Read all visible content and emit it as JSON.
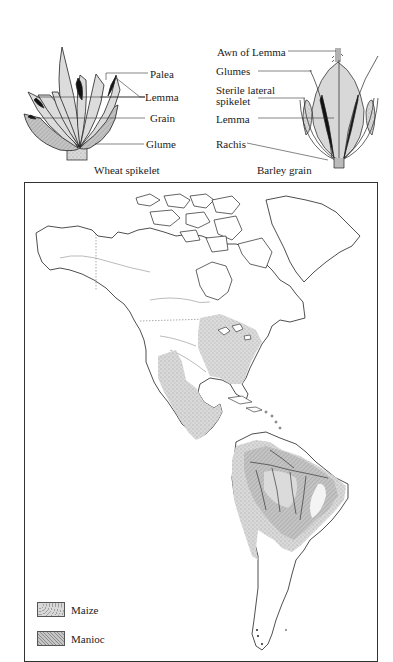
{
  "figures": {
    "wheat": {
      "caption": "Wheat spikelet",
      "labels": [
        "Palea",
        "Lemma",
        "Grain",
        "Glume"
      ]
    },
    "barley": {
      "caption": "Barley grain",
      "labels": [
        "Awn of Lemma",
        "Glumes",
        "Sterile lateral",
        "spikelet",
        "Lemma",
        "Rachis"
      ]
    }
  },
  "map": {
    "legend": [
      {
        "label": "Maize",
        "color": "#d4d4d4",
        "pattern": "stipple"
      },
      {
        "label": "Manioc",
        "color": "#c2c2c2",
        "pattern": "fine-hatch"
      }
    ],
    "colors": {
      "land": "#ffffff",
      "coast": "#222222",
      "maize": "#d6d6d6",
      "manioc": "#b9b9b9",
      "manioc_dark": "#9d9d9d"
    }
  }
}
